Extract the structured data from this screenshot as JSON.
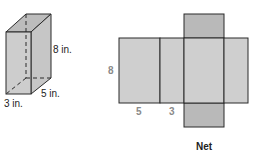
{
  "prism": {
    "height_label": "8 in.",
    "depth_label": "5 in.",
    "width_label": "3 in.",
    "colors": {
      "front": "#cdcdcd",
      "side": "#c6c6c6",
      "top": "#bcbcbc",
      "edge": "#2a2a2a"
    }
  },
  "net": {
    "title": "Net",
    "height_label": "8",
    "segment_label_1": "5",
    "segment_label_2": "3",
    "colors": {
      "face": "#cfcfcf",
      "flap": "#b9b9b9",
      "edge": "#2a2a2a",
      "label": "#8a8a8a"
    }
  }
}
